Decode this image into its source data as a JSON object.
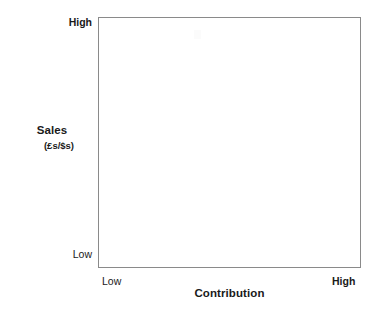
{
  "chart_data": {
    "type": "scatter",
    "title": "",
    "subtitle": "",
    "xlabel": "Contribution",
    "ylabel": "Sales",
    "ylabel_unit": "(£s/$s)",
    "x_tick_labels": [
      "Low",
      "High"
    ],
    "y_tick_labels": [
      "Low",
      "High"
    ],
    "xlim": [
      "Low",
      "High"
    ],
    "ylim": [
      "Low",
      "High"
    ],
    "grid": false,
    "legend": false,
    "legend_position": "none",
    "series": [],
    "annotations": []
  },
  "chart": {
    "title_fragment": "",
    "plot_area": {
      "background_color": "#ffffff",
      "border_color": "#8a8a8a"
    },
    "y_axis": {
      "title": "Sales",
      "unit": "(£s/$s)",
      "tick_high": "High",
      "tick_low": "Low"
    },
    "x_axis": {
      "title": "Contribution",
      "tick_low": "Low",
      "tick_high": "High"
    }
  },
  "colors": {
    "background": "#ffffff",
    "text": "#1a1a1a",
    "border": "#8a8a8a"
  }
}
